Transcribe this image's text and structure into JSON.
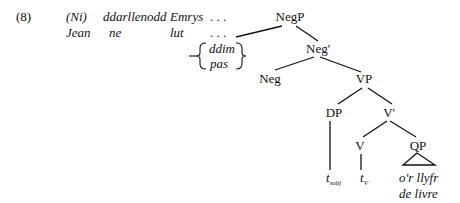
{
  "example_number": "(8)",
  "gloss": {
    "welsh": {
      "ni": "(Ni)",
      "verb": "ddarllenodd",
      "subject": "Emrys",
      "ellipsis": ". . ."
    },
    "french": {
      "subject": "Jean",
      "neg": "ne",
      "verb": "lut",
      "ellipsis": ". . ."
    }
  },
  "spec_options": {
    "welsh": "ddim",
    "french": "pas"
  },
  "tree": {
    "negp": "NegP",
    "negbar": "Neg'",
    "neg": "Neg",
    "vp": "VP",
    "dp": "DP",
    "vbar": "V'",
    "v": "V",
    "qp": "QP",
    "trace_subj": {
      "base": "t",
      "sub": "subj"
    },
    "trace_v": {
      "base": "t",
      "sub": "V"
    },
    "object_welsh": "o'r llyfr",
    "object_french": "de livre"
  }
}
